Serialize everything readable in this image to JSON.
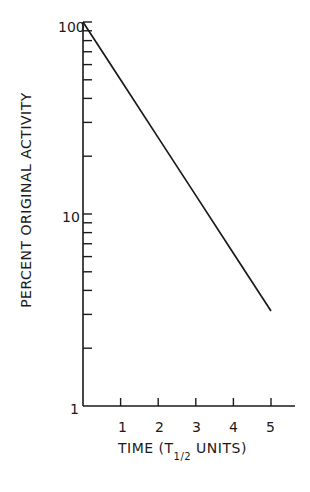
{
  "chart_data": {
    "type": "line",
    "title": "",
    "xlabel": "TIME (T1/2 UNITS)",
    "xlabel_main": "TIME (T",
    "xlabel_sub": "1/2",
    "xlabel_tail": " UNITS)",
    "ylabel": "PERCENT ORIGINAL ACTIVITY",
    "yscale": "log",
    "xlim": [
      0,
      5.5
    ],
    "ylim": [
      1,
      100
    ],
    "x_ticks": [
      "1",
      "2",
      "3",
      "4",
      "5"
    ],
    "y_tick_labels": [
      "1",
      "10",
      "100"
    ],
    "grid": false,
    "legend": null,
    "series": [
      {
        "name": "Radioactive decay",
        "x": [
          0,
          1,
          2,
          3,
          4,
          5
        ],
        "y": [
          100,
          50,
          25,
          12.5,
          6.25,
          3.125
        ]
      }
    ]
  }
}
